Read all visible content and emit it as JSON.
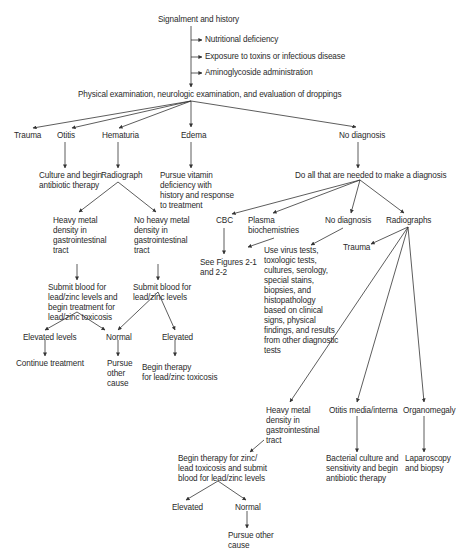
{
  "diagram": {
    "type": "flowchart",
    "colors": {
      "line": "#333333",
      "text": "#2a2a2a",
      "background": "#ffffff"
    },
    "nodes": {
      "signalment": "Signalment and history",
      "nutritional": "Nutritional deficiency",
      "exposure": "Exposure to toxins or infectious disease",
      "aminoglycoside": "Aminoglycoside administration",
      "physical_exam": "Physical examination, neurologic examination, and evaluation of droppings",
      "trauma": "Trauma",
      "otitis": "Otitis",
      "hematuria": "Hematuria",
      "edema": "Edema",
      "no_diagnosis": "No diagnosis",
      "culture_antibiotic": "Culture and begin\nantibiotic therapy",
      "radiograph": "Radiograph",
      "pursue_vitamin": "Pursue vitamin\ndeficiency with\nhistory and response\nto treatment",
      "do_all": "Do all that are needed to make a diagnosis",
      "heavy_metal_gi": "Heavy metal\ndensity in\ngastrointestinal\ntract",
      "no_heavy_metal_gi": "No heavy metal\ndensity in\ngastrointestinal\ntract",
      "cbc": "CBC",
      "plasma_biochem": "Plasma\nbiochemistries",
      "no_diagnosis_2": "No diagnosis",
      "radiographs": "Radiographs",
      "see_figures": "See Figures 2-1\nand 2-2",
      "use_virus_tests": "Use virus tests,\ntoxologic tests,\ncultures, serology,\nspecial stains,\nbiopsies, and\nhistopathology\nbased on clinical\nsigns, physical\nfindings, and results\nfrom other diagnostic\ntests",
      "trauma_2": "Trauma",
      "submit_blood_begin": "Submit blood for\nlead/zinc levels and\nbegin treatment for\nlead/zinc toxicosis",
      "submit_blood": "Submit blood for\nlead/zinc levels",
      "elevated_levels": "Elevated levels",
      "normal_1": "Normal",
      "elevated_1": "Elevated",
      "continue_treatment": "Continue treatment",
      "pursue_other_1": "Pursue\nother\ncause",
      "begin_therapy_1": "Begin therapy\nfor lead/zinc toxicosis",
      "heavy_metal_gi_2": "Heavy metal\ndensity in\ngastrointestinal\ntract",
      "otitis_media": "Otitis media/interna",
      "organomegaly": "Organomegaly",
      "begin_therapy_submit": "Begin therapy for zinc/\nlead toxicosis and submit\nblood for lead/zinc levels",
      "bacterial_culture": "Bacterial culture and\nsensitivity and begin\nantibiotic therapy",
      "laparoscopy": "Laparoscopy\nand biopsy",
      "elevated_2": "Elevated",
      "normal_2": "Normal",
      "pursue_other_2": "Pursue other\ncause"
    }
  }
}
